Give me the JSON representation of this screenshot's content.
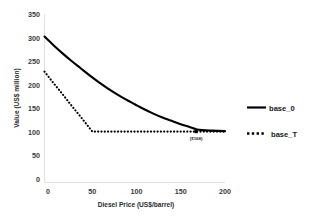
{
  "chart_data": {
    "type": "line",
    "title": "",
    "xlabel": "Diesel Price (US$/barrel)",
    "ylabel": "Value (US$ million)",
    "xlim": [
      0,
      200
    ],
    "ylim": [
      0,
      350
    ],
    "xticks": [
      0,
      50,
      100,
      150,
      200
    ],
    "yticks": [
      0,
      50,
      100,
      150,
      200,
      250,
      300,
      350
    ],
    "grid": false,
    "legend_position": "right",
    "series": [
      {
        "name": "base_0",
        "style": "solid",
        "color": "#000000",
        "x": [
          0,
          10,
          20,
          30,
          40,
          50,
          60,
          70,
          80,
          90,
          100,
          110,
          120,
          130,
          140,
          150,
          160,
          168,
          175,
          185,
          200
        ],
        "values": [
          303,
          285,
          268,
          252,
          237,
          222,
          208,
          195,
          183,
          172,
          162,
          152,
          143,
          135,
          128,
          121,
          115,
          110,
          108,
          107,
          106
        ]
      },
      {
        "name": "base_T",
        "style": "dotted",
        "color": "#000000",
        "x": [
          0,
          10,
          20,
          30,
          40,
          53,
          70,
          90,
          110,
          130,
          150,
          168,
          185,
          200
        ],
        "values": [
          230,
          206,
          183,
          159,
          136,
          105,
          105,
          105,
          105,
          105,
          105,
          105,
          105,
          105
        ]
      }
    ],
    "annotations": [
      {
        "label": "($168)",
        "x": 168,
        "y": 105,
        "marker": true
      }
    ]
  },
  "legend": {
    "items": [
      {
        "label": "base_0",
        "style": "solid"
      },
      {
        "label": "base_T",
        "style": "dotted"
      }
    ]
  },
  "axes": {
    "y_title": "Value (US$ million)",
    "x_title": "Diesel Price (US$/barrel)",
    "y_tick_labels": [
      "0",
      "50",
      "100",
      "150",
      "200",
      "250",
      "300",
      "350"
    ],
    "x_tick_labels": [
      "0",
      "50",
      "100",
      "150",
      "200"
    ]
  }
}
